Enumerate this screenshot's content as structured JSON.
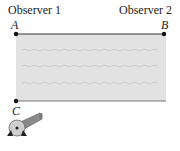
{
  "labels": {
    "observer1": "Observer 1",
    "observer2": "Observer 2",
    "pointA": "A",
    "pointB": "B",
    "pointC": "C"
  },
  "diagram": {
    "river_color": "#e2e2e2",
    "wave_color": "#c9c9c9",
    "bank_color": "#333333",
    "wave_rows": 3
  }
}
